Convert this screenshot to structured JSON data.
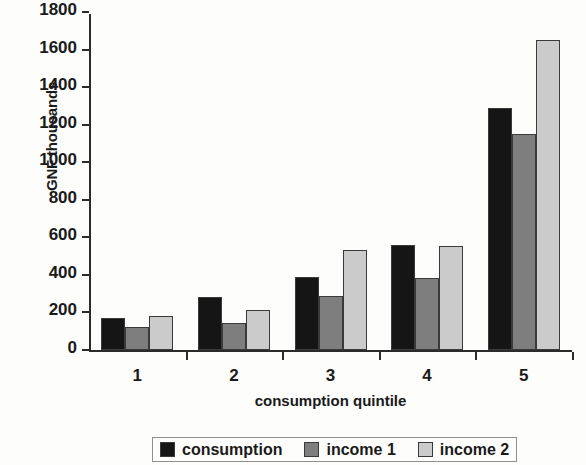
{
  "chart_data": {
    "type": "bar",
    "title": "",
    "xlabel": "consumption quintile",
    "ylabel": "GNF thousands",
    "categories": [
      "1",
      "2",
      "3",
      "4",
      "5"
    ],
    "series": [
      {
        "name": "consumption",
        "color": "#151515",
        "values": [
          170,
          280,
          390,
          560,
          1290
        ]
      },
      {
        "name": "income 1",
        "color": "#7e7e7e",
        "values": [
          120,
          145,
          290,
          385,
          1150
        ]
      },
      {
        "name": "income 2",
        "color": "#cbcbcb",
        "values": [
          180,
          215,
          530,
          555,
          1650
        ]
      }
    ],
    "ylim": [
      0,
      1800
    ],
    "yticks": [
      0,
      200,
      400,
      600,
      800,
      1000,
      1200,
      1400,
      1600,
      1800
    ],
    "ytick_labels": [
      "0",
      "200",
      "400",
      "600",
      "800",
      "1000",
      "1200",
      "1400",
      "1600",
      "1800"
    ],
    "grid": false,
    "legend_position": "bottom"
  }
}
